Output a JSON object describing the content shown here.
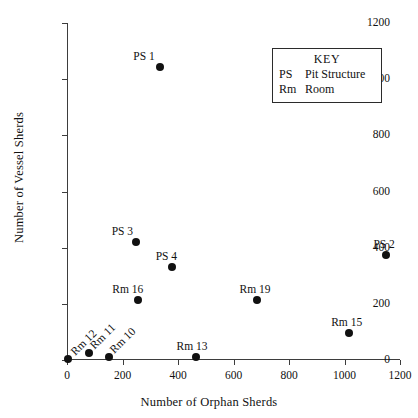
{
  "chart_data": {
    "type": "scatter",
    "title": "",
    "xlabel": "Number of Orphan Sherds",
    "ylabel": "Number of Vessel Sherds",
    "xlim": [
      0,
      1200
    ],
    "ylim": [
      0,
      1200
    ],
    "xticks": [
      0,
      200,
      400,
      600,
      800,
      1000,
      1200
    ],
    "yticks": [
      0,
      200,
      400,
      600,
      800,
      1000,
      1200
    ],
    "grid": false,
    "legend_position": "upper-right",
    "points": [
      {
        "label": "PS 1",
        "x": 335,
        "y": 1045,
        "label_pos": "above",
        "label_dx": -16,
        "label_dy": -16
      },
      {
        "label": "PS 2",
        "x": 1150,
        "y": 375,
        "label_pos": "above",
        "label_dx": -2,
        "label_dy": -16
      },
      {
        "label": "PS 3",
        "x": 250,
        "y": 420,
        "label_pos": "above",
        "label_dx": -14,
        "label_dy": -16
      },
      {
        "label": "PS 4",
        "x": 380,
        "y": 330,
        "label_pos": "above",
        "label_dx": -6,
        "label_dy": -16
      },
      {
        "label": "Rm 10",
        "x": 150,
        "y": 10,
        "label_pos": "rotated",
        "label_dx": 14,
        "label_dy": -22
      },
      {
        "label": "Rm 11",
        "x": 78,
        "y": 25,
        "label_pos": "rotated",
        "label_dx": 14,
        "label_dy": -22
      },
      {
        "label": "Rm 12",
        "x": 5,
        "y": 5,
        "label_pos": "rotated",
        "label_dx": 16,
        "label_dy": -22
      },
      {
        "label": "Rm 13",
        "x": 465,
        "y": 10,
        "label_pos": "above",
        "label_dx": -4,
        "label_dy": -16
      },
      {
        "label": "Rm 15",
        "x": 1015,
        "y": 95,
        "label_pos": "above",
        "label_dx": -2,
        "label_dy": -16
      },
      {
        "label": "Rm 16",
        "x": 255,
        "y": 215,
        "label_pos": "above",
        "label_dx": -10,
        "label_dy": -16
      },
      {
        "label": "Rm 19",
        "x": 685,
        "y": 215,
        "label_pos": "above",
        "label_dx": -2,
        "label_dy": -16
      }
    ],
    "marker_color": "#111111",
    "axis_color": "#3d3d3d"
  },
  "key": {
    "title": "KEY",
    "entries": [
      {
        "abbr": "PS",
        "term": "Pit Structure"
      },
      {
        "abbr": "Rm",
        "term": "Room"
      }
    ]
  }
}
